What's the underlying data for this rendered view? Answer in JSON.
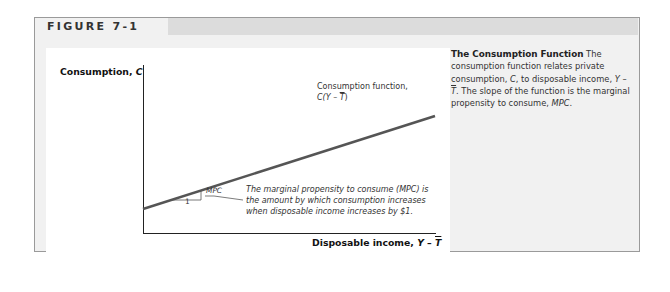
{
  "figure": {
    "label": "FIGURE 7-1"
  },
  "caption": {
    "title": "The Consumption Function",
    "text_parts": [
      "The consumption function relates private consumption, ",
      "C",
      ", to disposable income, ",
      "Y",
      " – ",
      "T",
      ". The slope of the function is the marginal propensity to consume, ",
      "MPC",
      "."
    ]
  },
  "diagram": {
    "y_axis_label_text": "Consumption, ",
    "y_axis_label_var": "C",
    "x_axis_label_text": "Disposable income, ",
    "x_axis_label_var_y": "Y",
    "x_axis_label_minus": " – ",
    "x_axis_label_var_t": "T",
    "curve_label_line1": "Consumption function,",
    "curve_label_c": "C(Y – ",
    "curve_label_t": "T",
    "curve_label_close": ")",
    "slope_rise_label": "MPC",
    "slope_run_label": "1",
    "annotation_lines": [
      "The marginal propensity to consume (MPC) is",
      "the amount by which consumption increases",
      "when disposable income increases by $1."
    ],
    "colors": {
      "curve": "#555555",
      "axes": "#222222",
      "header_bar": "#dcdcdc",
      "frame_bg": "#f1f1f1"
    }
  }
}
